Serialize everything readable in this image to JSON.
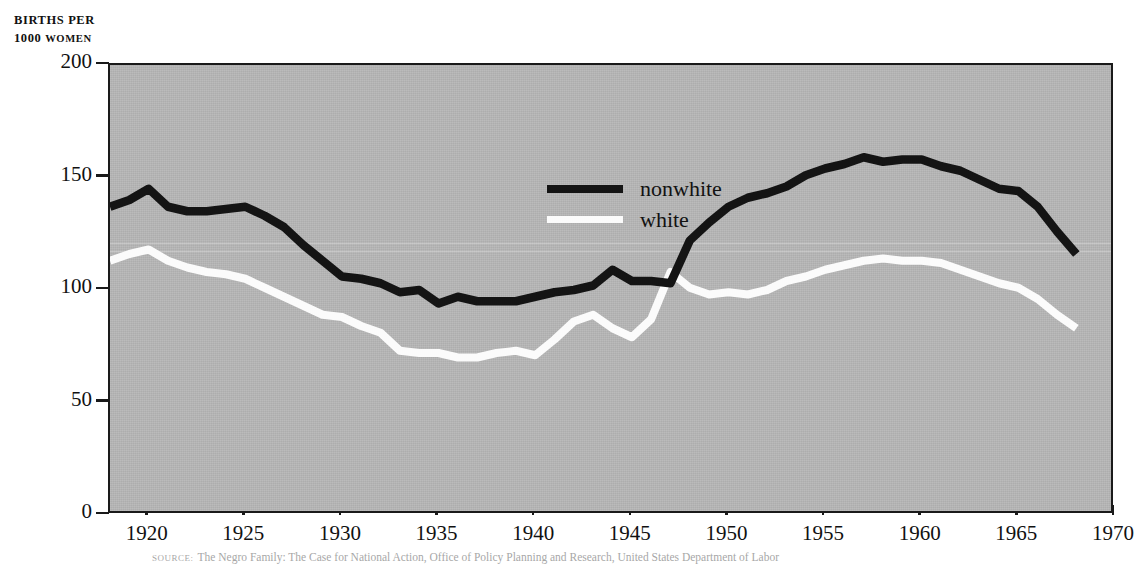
{
  "figure": {
    "y_axis_caption_line1": "BIRTHS PER",
    "y_axis_caption_line2_num": "1000",
    "y_axis_caption_line2_word": "WOMEN",
    "source_label": "SOURCE:",
    "source_text": "The Negro Family: The Case for National Action, Office of Policy Planning and Research, United States Department of Labor"
  },
  "legend": {
    "position": "inside-top-center",
    "entries": [
      {
        "label": "nonwhite",
        "color": "#141414"
      },
      {
        "label": "white",
        "color": "#fbfbfb"
      }
    ]
  },
  "chart_data": {
    "type": "line",
    "title": "",
    "subtitle": "",
    "xlabel": "",
    "ylabel": "BIRTHS PER 1000 WOMEN",
    "xlim": [
      1918,
      1970
    ],
    "ylim": [
      0,
      200
    ],
    "xticks": [
      1920,
      1925,
      1930,
      1935,
      1940,
      1945,
      1950,
      1955,
      1960,
      1965,
      1970
    ],
    "yticks": [
      0,
      50,
      100,
      150,
      200
    ],
    "xtick_labels": [
      "1920",
      "1925",
      "1930",
      "1935",
      "1940",
      "1945",
      "1950",
      "1955",
      "1960",
      "1965",
      "1970"
    ],
    "ytick_labels": [
      "0",
      "50",
      "100",
      "150",
      "200"
    ],
    "grid": false,
    "background": "#b4b4b4",
    "legend_position": "inside-top-center",
    "x": [
      1918,
      1919,
      1920,
      1921,
      1922,
      1923,
      1924,
      1925,
      1926,
      1927,
      1928,
      1929,
      1930,
      1931,
      1932,
      1933,
      1934,
      1935,
      1936,
      1937,
      1938,
      1939,
      1940,
      1941,
      1942,
      1943,
      1944,
      1945,
      1946,
      1947,
      1948,
      1949,
      1950,
      1951,
      1952,
      1953,
      1954,
      1955,
      1956,
      1957,
      1958,
      1959,
      1960,
      1961,
      1962,
      1963,
      1964,
      1965,
      1966,
      1967,
      1968
    ],
    "series": [
      {
        "name": "nonwhite",
        "color": "#141414",
        "values": [
          137,
          140,
          145,
          137,
          135,
          135,
          136,
          137,
          133,
          128,
          120,
          113,
          106,
          105,
          103,
          99,
          100,
          94,
          97,
          95,
          95,
          95,
          97,
          99,
          100,
          102,
          109,
          104,
          104,
          103,
          122,
          130,
          137,
          141,
          143,
          146,
          151,
          154,
          156,
          159,
          157,
          158,
          158,
          155,
          153,
          149,
          145,
          144,
          137,
          126,
          116
        ]
      },
      {
        "name": "white",
        "color": "#fbfbfb",
        "values": [
          113,
          116,
          118,
          113,
          110,
          108,
          107,
          105,
          101,
          97,
          93,
          89,
          88,
          84,
          81,
          73,
          72,
          72,
          70,
          70,
          72,
          73,
          71,
          78,
          86,
          89,
          83,
          79,
          87,
          108,
          101,
          98,
          99,
          98,
          100,
          104,
          106,
          109,
          111,
          113,
          114,
          113,
          113,
          112,
          109,
          106,
          103,
          101,
          96,
          89,
          83
        ]
      }
    ]
  }
}
